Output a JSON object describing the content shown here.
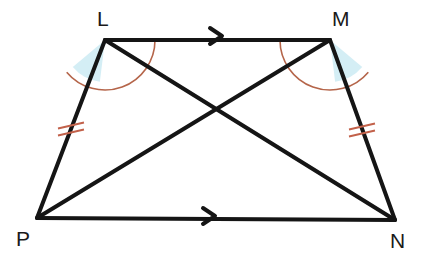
{
  "figure": {
    "background_color": "#ffffff",
    "stroke_color": "#151515",
    "stroke_width": 4,
    "mark_color": "#c2614a",
    "angle_fill_color": "#d4eef5",
    "angle_arc_color": "#b5654a",
    "label_color": "#1a1a1a"
  },
  "vertices": {
    "L": {
      "name": "L",
      "x": 105,
      "y": 40,
      "label_x": 97,
      "label_y": 26
    },
    "M": {
      "name": "M",
      "x": 330,
      "y": 40,
      "label_x": 332,
      "label_y": 26
    },
    "N": {
      "name": "N",
      "x": 395,
      "y": 220,
      "label_x": 390,
      "label_y": 248
    },
    "P": {
      "name": "P",
      "x": 37,
      "y": 218,
      "label_x": 16,
      "label_y": 246
    }
  },
  "sides": [
    {
      "name": "LM",
      "from": "L",
      "to": "M",
      "mark": "single-arrow"
    },
    {
      "name": "MN",
      "from": "M",
      "to": "N",
      "mark": "double-tick"
    },
    {
      "name": "PN",
      "from": "P",
      "to": "N",
      "mark": "single-arrow"
    },
    {
      "name": "LP",
      "from": "L",
      "to": "P",
      "mark": "double-tick"
    }
  ],
  "diagonals": [
    {
      "name": "LN",
      "from": "L",
      "to": "N"
    },
    {
      "name": "PM",
      "from": "P",
      "to": "M"
    }
  ],
  "intersection": {
    "name": "diagonal-intersection",
    "x": 216,
    "y": 110
  },
  "angle_marks": [
    {
      "name": "angle-at-L",
      "vertex": "L",
      "fill_sector": {
        "radius": 42,
        "start_deg": 97,
        "end_deg": 140
      },
      "outer_arc": {
        "radius": 50,
        "start_deg": 0,
        "end_deg": 140
      }
    },
    {
      "name": "angle-at-M",
      "vertex": "M",
      "fill_sector": {
        "radius": 42,
        "start_deg": 40,
        "end_deg": 83
      },
      "outer_arc": {
        "radius": 50,
        "start_deg": 40,
        "end_deg": 180
      }
    }
  ],
  "tick_marks": [
    {
      "name": "tick-LP",
      "x": 71,
      "y": 129,
      "count": 2
    },
    {
      "name": "tick-MN",
      "x": 362,
      "y": 130,
      "count": 2
    }
  ],
  "arrow_marks": [
    {
      "name": "arrow-LM",
      "x": 217,
      "y": 36
    },
    {
      "name": "arrow-PN",
      "x": 210,
      "y": 216
    }
  ]
}
